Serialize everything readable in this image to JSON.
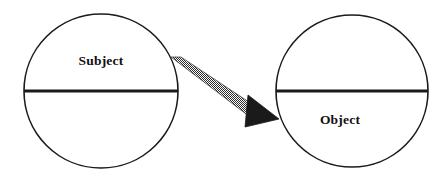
{
  "diagram": {
    "type": "relationship-diagram",
    "background_color": "#ffffff",
    "stroke_color": "#1a1a1a",
    "nodes": [
      {
        "id": "subject",
        "label": "Subject",
        "label_position": "upper-half",
        "center_x": 101,
        "center_y": 91,
        "radius": 77,
        "divider_y": 91,
        "label_x": 101,
        "label_y": 62
      },
      {
        "id": "object",
        "label": "Object",
        "label_position": "lower-half",
        "center_x": 352,
        "center_y": 91,
        "radius": 76,
        "divider_y": 91,
        "label_x": 340,
        "label_y": 121
      }
    ],
    "connector": {
      "id": "subject-to-object-arrow",
      "label": "",
      "style": "halftone-textured-tapered-arrow",
      "fill_color": "#2b2b2b",
      "from_node": "subject",
      "to_node": "object",
      "start_x": 172,
      "start_y": 60,
      "tip_x": 279,
      "tip_y": 119,
      "arrowhead": "solid-filled-triangle"
    }
  }
}
